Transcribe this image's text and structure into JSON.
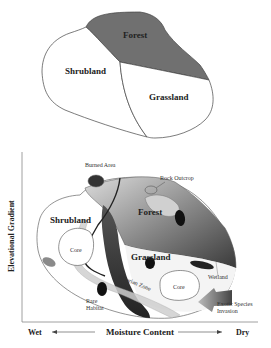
{
  "top_diagram": {
    "regions": [
      {
        "name": "Forest",
        "fill": "#6f6f6f"
      },
      {
        "name": "Shrubland",
        "fill": "#ffffff"
      },
      {
        "name": "Grassland",
        "fill": "#ffffff"
      }
    ]
  },
  "bottom_diagram": {
    "zones": {
      "shrubland": "Shrubland",
      "forest": "Forest",
      "grassland": "Grassland",
      "core_left": "Core",
      "core_right": "Core"
    },
    "annotations": {
      "burned_area": "Burned Area",
      "rock_outcrop": "Rock Outcrop",
      "wetland": "Wetland",
      "rare_habitat_line1": "Rare",
      "rare_habitat_line2": "Habitat",
      "exotic_line1": "Exotic Species",
      "exotic_line2": "Invasion",
      "riparian": "Riparian Zone"
    },
    "axes": {
      "y_label": "Elevational Gradient",
      "x_label": "Moisture Content",
      "x_left": "Wet",
      "x_right": "Dry"
    }
  }
}
